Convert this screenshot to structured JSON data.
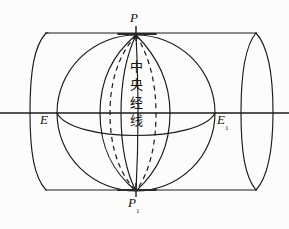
{
  "figure": {
    "stroke_color": "#1a1a1a",
    "background_color": "#fcfcfa",
    "labels": {
      "north_pole": "P",
      "south_pole": "P",
      "south_pole_subscript": "1",
      "equator_left": "E",
      "equator_right": "E",
      "equator_right_subscript": "1"
    },
    "annotation": {
      "central_meridian_chars": [
        "中",
        "央",
        "经",
        "线"
      ],
      "central_meridian_text": "中央经线"
    },
    "geometry": {
      "cylinder": {
        "top_y": 33,
        "bottom_y": 190,
        "left_front_x": 30,
        "left_back_x": 46,
        "right_back_x": 256,
        "right_front_x": 273,
        "ellipse_ry": 79,
        "ellipse_rx": 15
      },
      "sphere": {
        "center_x": 136,
        "center_y": 113,
        "radius_x": 79,
        "radius_y": 78
      },
      "axis": {
        "equator_line_y": 113,
        "x_start": 0,
        "x_end": 289
      },
      "poles": {
        "north": {
          "x": 136,
          "y": 35
        },
        "south": {
          "x": 136,
          "y": 191
        }
      },
      "meridians_solid_offsets": [
        -38,
        -14,
        2,
        34
      ],
      "meridians_dashed_offsets": [
        -26,
        22
      ]
    }
  }
}
